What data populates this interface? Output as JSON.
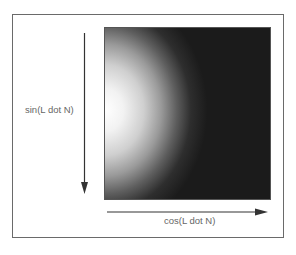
{
  "diagram": {
    "axes": {
      "vertical": {
        "label": "sin(L dot N)",
        "direction": "down"
      },
      "horizontal": {
        "label": "cos(L dot N)",
        "direction": "right"
      }
    },
    "image": {
      "type": "radial-gradient",
      "highlight_position": "left-center",
      "highlight_color": "#ffffff",
      "falloff_color": "#1b1b1b"
    },
    "colors": {
      "frame": "#6a6a6a",
      "arrow": "#333333",
      "label": "#666666",
      "background": "#ffffff"
    }
  }
}
